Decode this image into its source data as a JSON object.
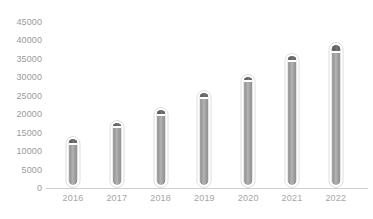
{
  "chart_data": {
    "type": "bar",
    "title": "",
    "subtitle": "",
    "xlabel": "",
    "ylabel": "",
    "categories": [
      "2016",
      "2017",
      "2018",
      "2019",
      "2020",
      "2021",
      "2022"
    ],
    "values": [
      14000,
      18500,
      22000,
      26500,
      31000,
      36500,
      39500
    ],
    "cap_values": [
      13000,
      17500,
      21000,
      25500,
      30000,
      35500,
      38000
    ],
    "ylim": [
      0,
      45000
    ],
    "ytick_labels": [
      "0",
      "5000",
      "10000",
      "15000",
      "20000",
      "25000",
      "30000",
      "35000",
      "40000",
      "45000"
    ],
    "ytick_values": [
      0,
      5000,
      10000,
      15000,
      20000,
      25000,
      30000,
      35000,
      40000,
      45000
    ],
    "grid": false,
    "legend": null,
    "series": [
      {
        "name": "",
        "values": [
          14000,
          18500,
          22000,
          26500,
          31000,
          36500,
          39500
        ]
      }
    ],
    "colors": {
      "background": "#ffffff",
      "bar_fill": "#a0a0a0",
      "bar_cap": "#646464",
      "bar_outline": "#dedede",
      "axis_line": "#cfcfcf",
      "ytick_text": "#9a9a9a",
      "xtick_text": "#a5a5a5"
    }
  }
}
